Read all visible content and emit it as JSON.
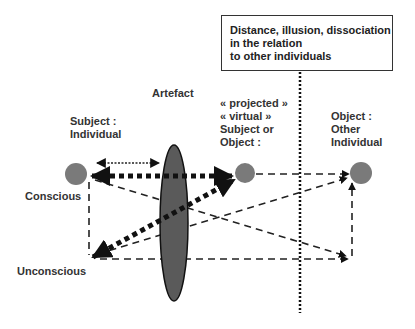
{
  "note_box": {
    "text": "Distance, illusion, dissociation\nin the relation\nto other individuals"
  },
  "labels": {
    "artefact": "Artefact",
    "subject": "Subject :\nIndividual",
    "projected": "« projected »\n« virtual »\nSubject or\nObject :",
    "object": "Object :\nOther\nIndividual",
    "conscious": "Conscious",
    "unconscious": "Unconscious"
  },
  "colors": {
    "node_fill": "#7a7a7a",
    "artefact_fill": "#5a5a5a",
    "stroke": "#111111"
  }
}
